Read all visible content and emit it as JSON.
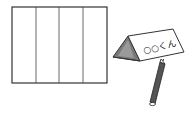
{
  "illustration": {
    "paper": {
      "sections": 4,
      "fold_lines": 3,
      "stroke_color": "#333333",
      "fill_color": "#ffffff"
    },
    "name_tag": {
      "text": "○○くん",
      "shape": "triangular-prism",
      "side_fill": "#7a7a7a",
      "face_fill": "#ffffff"
    },
    "pencil": {
      "body_color": "#555555",
      "tip_color": "#ffffff"
    }
  }
}
